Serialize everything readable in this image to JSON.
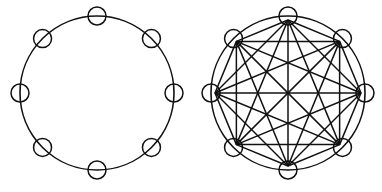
{
  "diagram": {
    "type": "graph-comparison",
    "stroke_color": "#111111",
    "background": "#ffffff",
    "graphs": [
      {
        "name": "ring-graph",
        "description": "8 nodes arranged on a circle, connected only by the circular ring",
        "center": [
          97,
          93
        ],
        "ring_radius": 77,
        "node_count": 8,
        "node_radius": 9,
        "edges": "ring-only"
      },
      {
        "name": "complete-graph",
        "description": "8 nodes arranged on a circle, every pair connected by a straight edge (K8)",
        "center": [
          288,
          93
        ],
        "ring_radius": 77,
        "hub_radius": 73,
        "node_count": 8,
        "node_radius": 9,
        "edges": "complete"
      }
    ]
  }
}
